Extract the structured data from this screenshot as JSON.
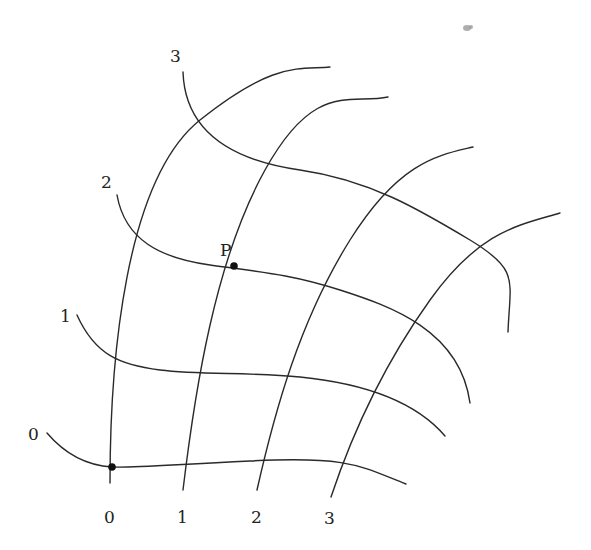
{
  "diagram": {
    "colors": {
      "line": "#2a2a2a",
      "text": "#222222",
      "background": "#ffffff"
    },
    "u_curves": {
      "labels": [
        "0",
        "1",
        "2",
        "3"
      ],
      "paths": [
        "M 110 483 C 110 360, 125 180, 200 120 S 300 70, 330 67",
        "M 183 490 C 195 390, 215 260, 265 170 S 350 105, 388 97",
        "M 257 490 C 275 410, 300 320, 350 240 S 440 155, 473 147",
        "M 331 497 C 350 440, 380 370, 430 300 S 520 225, 560 213"
      ]
    },
    "v_curves": {
      "labels": [
        "0",
        "1",
        "2",
        "3"
      ],
      "paths": [
        "M 47 433 C 70 460, 95 466, 112 467 S 150 466, 250 461 S 360 466, 406 484",
        "M 77 315 C 95 355, 120 365, 160 370 S 250 372, 300 377 S 410 395, 445 436",
        "M 117 195 C 125 240, 160 258, 210 265 S 290 274, 340 290 S 460 330, 470 403",
        "M 183 72 C 185 130, 230 160, 300 170 S 420 210, 470 240 S 510 280, 508 332"
      ]
    },
    "axis_label_positions": {
      "u": [
        [
          110,
          523
        ],
        [
          183,
          523
        ],
        [
          257,
          523
        ],
        [
          331,
          523
        ]
      ],
      "v": [
        [
          33,
          441
        ],
        [
          66,
          322
        ],
        [
          107,
          189
        ],
        [
          175,
          63
        ]
      ]
    },
    "points": [
      {
        "name": "P",
        "label": "P",
        "x": 234,
        "y": 266,
        "label_x": 222,
        "label_y": 256
      },
      {
        "name": "origin",
        "label": "",
        "x": 112,
        "y": 467
      }
    ]
  }
}
